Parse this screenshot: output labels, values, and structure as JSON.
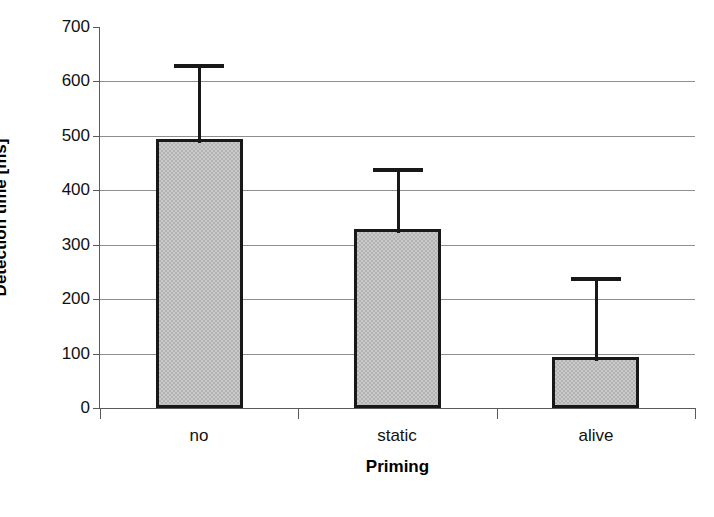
{
  "chart_data": {
    "type": "bar",
    "title": "",
    "categories": [
      "no",
      "static",
      "alive"
    ],
    "values": [
      494,
      329,
      94
    ],
    "error_upper": [
      632,
      441,
      241
    ],
    "series": [
      {
        "name": "Detection time",
        "values": [
          494,
          329,
          94
        ],
        "error_upper": [
          632,
          441,
          241
        ]
      }
    ],
    "xlabel": "Priming",
    "ylabel": "Detection time [ms]",
    "ylim": [
      0,
      700
    ],
    "yticks": [
      0,
      100,
      200,
      300,
      400,
      500,
      600,
      700
    ],
    "ytick_labels": [
      "0",
      "100",
      "200",
      "300",
      "400",
      "500",
      "600",
      "700"
    ],
    "grid": "horizontal",
    "legend": "none",
    "bar_fill_color": "#c9c9c9",
    "bar_edge_color": "#181818",
    "gridline_color": "#8e8e8e",
    "axis_color": "#5a5a5a",
    "background_color": "#ffffff"
  },
  "caption_fragment": ""
}
